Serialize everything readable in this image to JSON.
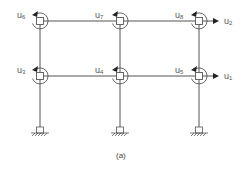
{
  "caption": "(a)",
  "colors": {
    "line": "#555555",
    "text": "#555555"
  },
  "columns_x": [
    40,
    120,
    199
  ],
  "levels_y": {
    "top": 21,
    "middle": 76,
    "support": 131
  },
  "nodes": [
    {
      "id": "u6",
      "base": "u",
      "sub": "6",
      "col": 0,
      "level": "top",
      "label_x": 17,
      "label_y": 11
    },
    {
      "id": "u7",
      "base": "u",
      "sub": "7",
      "col": 1,
      "level": "top",
      "label_x": 95,
      "label_y": 11
    },
    {
      "id": "u8",
      "base": "u",
      "sub": "8",
      "col": 2,
      "level": "top",
      "label_x": 175,
      "label_y": 11
    },
    {
      "id": "u3",
      "base": "u",
      "sub": "3",
      "col": 0,
      "level": "middle",
      "label_x": 17,
      "label_y": 66
    },
    {
      "id": "u4",
      "base": "u",
      "sub": "4",
      "col": 1,
      "level": "middle",
      "label_x": 95,
      "label_y": 66
    },
    {
      "id": "u5",
      "base": "u",
      "sub": "5",
      "col": 2,
      "level": "middle",
      "label_x": 175,
      "label_y": 66
    }
  ],
  "horizontal_dofs": [
    {
      "id": "u2",
      "base": "u",
      "sub": "2",
      "level": "top",
      "label_x": 224,
      "label_y": 17
    },
    {
      "id": "u1",
      "base": "u",
      "sub": "1",
      "level": "middle",
      "label_x": 224,
      "label_y": 72
    }
  ],
  "supports": [
    {
      "type": "fixed",
      "col": 0
    },
    {
      "type": "fixed",
      "col": 1
    },
    {
      "type": "fixed",
      "col": 2
    }
  ]
}
